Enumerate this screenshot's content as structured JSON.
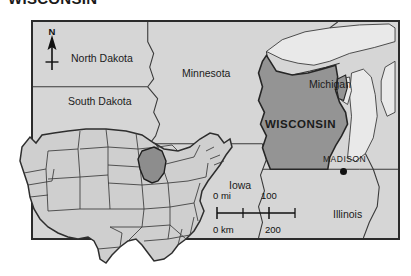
{
  "figure": {
    "title": "WISCONSIN",
    "type": "reference-map",
    "subject_state": "Wisconsin"
  },
  "main_map": {
    "frame": {
      "border_color": "#2b2b2b",
      "background_color": "#d6d6d6"
    },
    "highlight_color": "#949494",
    "land_color": "#d6d6d6",
    "water_color": "#e8e8e8",
    "border_line_color": "#3a3a3a",
    "labels": {
      "north_dakota": "North Dakota",
      "south_dakota": "South Dakota",
      "minnesota": "Minnesota",
      "michigan": "Michigan",
      "wisconsin": "WISCONSIN",
      "iowa": "Iowa",
      "illinois": "Illinois"
    },
    "capital": {
      "name": "MADISON",
      "marker": "filled-circle",
      "marker_color": "#111111"
    }
  },
  "compass": {
    "icon": "north-arrow-icon",
    "letter": "N",
    "direction": "north"
  },
  "scale_bar": {
    "miles": {
      "start": "0 mi",
      "end": "100"
    },
    "kilometers": {
      "start": "0 km",
      "end": "200"
    },
    "tick_count": 3
  },
  "inset_map": {
    "name": "united-states-locator",
    "highlighted_state": "Wisconsin",
    "highlight_color": "#8d8d8d",
    "land_color": "#cfcfcf",
    "outline_color": "#333333"
  }
}
